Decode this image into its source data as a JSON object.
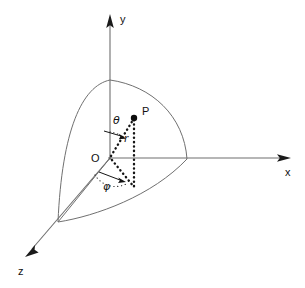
{
  "figure": {
    "background_color": "#ffffff",
    "ink_color": "#111111",
    "line_color": "#707070",
    "width": 305,
    "height": 288
  },
  "axes": [
    {
      "id": "y-axis",
      "label": "y",
      "direction": "up",
      "label_x": 120,
      "label_y": 23,
      "from": [
        110,
        158
      ],
      "to": [
        110,
        16
      ],
      "arrow_at": [
        110,
        16
      ]
    },
    {
      "id": "x-axis",
      "label": "x",
      "direction": "right",
      "label_x": 285,
      "label_y": 176,
      "from": [
        110,
        158
      ],
      "to": [
        289,
        158
      ],
      "arrow_at": [
        289,
        158
      ]
    },
    {
      "id": "z-axis",
      "label": "z",
      "direction": "lower-left",
      "label_x": 18,
      "label_y": 275,
      "from": [
        110,
        158
      ],
      "to": [
        26,
        256
      ],
      "arrow_at": [
        26,
        256
      ]
    }
  ],
  "origin": {
    "label": "O",
    "label_x": 91,
    "label_y": 160,
    "x": 110,
    "y": 158
  },
  "point": {
    "label": "P",
    "label_x": 142,
    "label_y": 115,
    "x": 134,
    "y": 118,
    "radius": 3.2
  },
  "angles": [
    {
      "id": "theta",
      "label": "θ",
      "name": "polar-angle",
      "label_x": 113,
      "label_y": 124,
      "measured_from": "y-axis",
      "measured_to": "radius-vector"
    },
    {
      "id": "phi",
      "label": "φ",
      "name": "azimuthal-angle",
      "label_x": 105,
      "label_y": 188,
      "measured_from": "z-axis",
      "measured_to": "xz-plane-projection"
    }
  ],
  "segments": [
    {
      "id": "radius",
      "label": "r",
      "label_x": 124,
      "label_y": 140,
      "style": "dotted",
      "from": [
        110,
        158
      ],
      "to": [
        134,
        118
      ]
    },
    {
      "id": "vertical-drop",
      "label": "",
      "style": "dotted",
      "from": [
        134,
        118
      ],
      "to": [
        134,
        186
      ]
    },
    {
      "id": "projection",
      "label": "",
      "style": "dotted",
      "from": [
        110,
        158
      ],
      "to": [
        134,
        186
      ]
    }
  ],
  "shell": {
    "id": "octant-shell",
    "description": "quarter spherical surface in the positive octant",
    "top_vertex": [
      110,
      80
    ],
    "x_vertex": [
      187,
      159
    ],
    "z_vertex": [
      58,
      222
    ],
    "stroke": "#707070"
  }
}
